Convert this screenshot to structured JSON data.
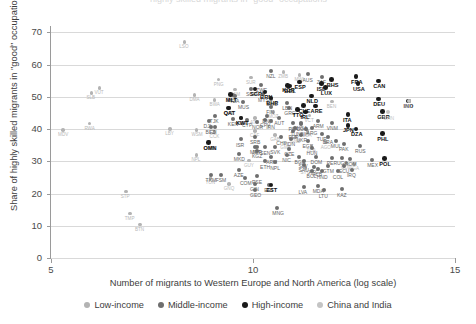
{
  "title_sliver": "highly skilled migrants in \"good\" occupations",
  "axes": {
    "ylabel": "Share of highly skilled migrants in \"good\" occupations (%)",
    "xlabel": "Number of migrants to Western Europe and North America (log scale)",
    "yticks": [
      0,
      10,
      20,
      30,
      40,
      50,
      60,
      70
    ],
    "xticks": [
      5,
      10,
      15
    ],
    "xlim": [
      5,
      15
    ],
    "ylim": [
      0,
      72
    ]
  },
  "legend": {
    "position": "bottom-center",
    "items": [
      {
        "label": "Low-income",
        "color": "#b3b3b3",
        "key": "low"
      },
      {
        "label": "Middle-income",
        "color": "#6e6e6e",
        "key": "mid"
      },
      {
        "label": "High-income",
        "color": "#1a1a1a",
        "key": "high"
      },
      {
        "label": "China and India",
        "color": "#c4c4c4",
        "key": "ci"
      }
    ]
  },
  "chart_data": {
    "type": "scatter",
    "title": "Share of highly skilled migrants in \"good\" occupations",
    "xlabel": "Number of migrants to Western Europe and North America (log scale)",
    "ylabel": "Share of highly skilled migrants in \"good\" occupations (%)",
    "xlim": [
      5,
      15
    ],
    "ylim": [
      0,
      72
    ],
    "grid": "horizontal",
    "series": [
      {
        "name": "Low-income",
        "color": "#b3b3b3",
        "points": [
          {
            "label": "LSO",
            "x": 8.3,
            "y": 67.0
          },
          {
            "label": "MWI",
            "x": 11.15,
            "y": 56.8
          },
          {
            "label": "ZMB",
            "x": 10.75,
            "y": 57.8
          },
          {
            "label": "PNG",
            "x": 9.15,
            "y": 55.4
          },
          {
            "label": "VUT",
            "x": 6.2,
            "y": 52.8
          },
          {
            "label": "SLB",
            "x": 6.0,
            "y": 51.2
          },
          {
            "label": "NAM",
            "x": 9.55,
            "y": 52.3
          },
          {
            "label": "DMA",
            "x": 8.55,
            "y": 50.6
          },
          {
            "label": "BWA",
            "x": 9.05,
            "y": 49.1
          },
          {
            "label": "MOZ",
            "x": 10.5,
            "y": 45.4
          },
          {
            "label": "BEN",
            "x": 11.95,
            "y": 48.6
          },
          {
            "label": "ATG",
            "x": 10.05,
            "y": 43.4
          },
          {
            "label": "VCT",
            "x": 11.4,
            "y": 44.2
          },
          {
            "label": "STP",
            "x": 6.85,
            "y": 20.6
          },
          {
            "label": "TMP",
            "x": 6.95,
            "y": 13.8
          },
          {
            "label": "BTN",
            "x": 7.2,
            "y": 10.4
          },
          {
            "label": "MDV",
            "x": 5.3,
            "y": 39.7
          },
          {
            "label": "WSM",
            "x": 8.6,
            "y": 39.7
          },
          {
            "label": "CCK",
            "x": 9.05,
            "y": 39.1
          },
          {
            "label": "CAF",
            "x": 10.05,
            "y": 39.4
          },
          {
            "label": "GAB",
            "x": 10.55,
            "y": 38.2
          },
          {
            "label": "LCA",
            "x": 11.35,
            "y": 39.5
          },
          {
            "label": "GNB",
            "x": 11.05,
            "y": 37.6
          },
          {
            "label": "AGO",
            "x": 11.8,
            "y": 35.9
          },
          {
            "label": "GMB",
            "x": 10.8,
            "y": 35.8
          },
          {
            "label": "TCA",
            "x": 11.45,
            "y": 34.7
          },
          {
            "label": "GNQ",
            "x": 9.4,
            "y": 22.9
          },
          {
            "label": "TON",
            "x": 8.95,
            "y": 24.9
          },
          {
            "label": "SYC",
            "x": 11.3,
            "y": 28.0
          },
          {
            "label": "COD",
            "x": 12.3,
            "y": 29.6
          },
          {
            "label": "RWA",
            "x": 5.95,
            "y": 41.8
          },
          {
            "label": "LBY",
            "x": 7.95,
            "y": 40.1
          },
          {
            "label": "NPL",
            "x": 8.6,
            "y": 32.0
          },
          {
            "label": "GUY",
            "x": 9.9,
            "y": 30.3
          },
          {
            "label": "UGA",
            "x": 12.5,
            "y": 29.2
          },
          {
            "label": "SUR",
            "x": 9.95,
            "y": 56.0
          }
        ]
      },
      {
        "name": "Middle-income",
        "color": "#6e6e6e",
        "points": [
          {
            "label": "NZL",
            "x": 10.45,
            "y": 58.1
          },
          {
            "label": "AUS",
            "x": 11.35,
            "y": 57.0
          },
          {
            "label": "ZAF",
            "x": 11.7,
            "y": 56.3
          },
          {
            "label": "ZWE",
            "x": 10.2,
            "y": 53.6
          },
          {
            "label": "SGP",
            "x": 9.95,
            "y": 52.4
          },
          {
            "label": "MYS",
            "x": 10.25,
            "y": 50.8
          },
          {
            "label": "TZA",
            "x": 9.55,
            "y": 50.3
          },
          {
            "label": "MUS",
            "x": 9.75,
            "y": 48.5
          },
          {
            "label": "SWE",
            "x": 10.45,
            "y": 49.5
          },
          {
            "label": "LBN",
            "x": 10.85,
            "y": 48.2
          },
          {
            "label": "FIN",
            "x": 10.45,
            "y": 47.0
          },
          {
            "label": "GRC",
            "x": 10.9,
            "y": 46.5
          },
          {
            "label": "QAT",
            "x": 9.4,
            "y": 46.5
          },
          {
            "label": "TJK",
            "x": 9.05,
            "y": 44.2
          },
          {
            "label": "DJI",
            "x": 8.9,
            "y": 42.5
          },
          {
            "label": "KEN",
            "x": 9.5,
            "y": 43.1
          },
          {
            "label": "CPV",
            "x": 10.3,
            "y": 42.8
          },
          {
            "label": "COG",
            "x": 11.2,
            "y": 41.6
          },
          {
            "label": "KWT",
            "x": 9.7,
            "y": 43.6
          },
          {
            "label": "CYP",
            "x": 9.85,
            "y": 42.9
          },
          {
            "label": "DNK",
            "x": 10.35,
            "y": 44.2
          },
          {
            "label": "AUT",
            "x": 10.65,
            "y": 43.4
          },
          {
            "label": "NOR",
            "x": 10.1,
            "y": 42.3
          },
          {
            "label": "IRN",
            "x": 10.45,
            "y": 42.4
          },
          {
            "label": "PSA",
            "x": 11.0,
            "y": 41.8
          },
          {
            "label": "TUN",
            "x": 11.05,
            "y": 40.2
          },
          {
            "label": "ARG",
            "x": 11.45,
            "y": 40.3
          },
          {
            "label": "PER",
            "x": 11.0,
            "y": 39.3
          },
          {
            "label": "UKR",
            "x": 11.2,
            "y": 38.3
          },
          {
            "label": "TUR",
            "x": 11.7,
            "y": 38.4
          },
          {
            "label": "BRA",
            "x": 11.85,
            "y": 37.5
          },
          {
            "label": "SRB",
            "x": 10.05,
            "y": 37.7
          },
          {
            "label": "ISR",
            "x": 9.7,
            "y": 36.8
          },
          {
            "label": "CHL",
            "x": 10.7,
            "y": 37.4
          },
          {
            "label": "IDN",
            "x": 10.95,
            "y": 36.9
          },
          {
            "label": "EGY",
            "x": 11.35,
            "y": 36.3
          },
          {
            "label": "MUI",
            "x": 12.05,
            "y": 36.3
          },
          {
            "label": "OMN",
            "x": 8.9,
            "y": 35.9
          },
          {
            "label": "MRT",
            "x": 10.05,
            "y": 34.6
          },
          {
            "label": "KGZ",
            "x": 10.1,
            "y": 33.2
          },
          {
            "label": "JOR",
            "x": 10.1,
            "y": 34.5
          },
          {
            "label": "SEN",
            "x": 10.3,
            "y": 34.3
          },
          {
            "label": "SVK",
            "x": 10.55,
            "y": 34.4
          },
          {
            "label": "CZE",
            "x": 10.9,
            "y": 33.8
          },
          {
            "label": "HUN",
            "x": 11.45,
            "y": 34.1
          },
          {
            "label": "NGA",
            "x": 11.2,
            "y": 42.0
          },
          {
            "label": "PAK",
            "x": 12.25,
            "y": 35.3
          },
          {
            "label": "RUS",
            "x": 12.65,
            "y": 34.7
          },
          {
            "label": "NIC",
            "x": 10.85,
            "y": 32.1
          },
          {
            "label": "ARM",
            "x": 10.45,
            "y": 31.5
          },
          {
            "label": "BGR",
            "x": 11.15,
            "y": 31.3
          },
          {
            "label": "DOM",
            "x": 11.55,
            "y": 31.3
          },
          {
            "label": "PER2",
            "x": 11.95,
            "y": 31.0
          },
          {
            "label": "UGA2",
            "x": 12.2,
            "y": 31.0
          },
          {
            "label": "ROM",
            "x": 12.4,
            "y": 30.8
          },
          {
            "label": "MEX",
            "x": 12.95,
            "y": 30.5
          },
          {
            "label": "SLV",
            "x": 11.25,
            "y": 30.1
          },
          {
            "label": "ETH",
            "x": 10.3,
            "y": 30.0
          },
          {
            "label": "NPL2",
            "x": 10.55,
            "y": 29.7
          },
          {
            "label": "SAU",
            "x": 11.25,
            "y": 28.9
          },
          {
            "label": "AFG",
            "x": 11.5,
            "y": 28.3
          },
          {
            "label": "GTM",
            "x": 11.85,
            "y": 28.6
          },
          {
            "label": "ECU",
            "x": 12.25,
            "y": 28.5
          },
          {
            "label": "ALB",
            "x": 11.6,
            "y": 27.6
          },
          {
            "label": "MKD",
            "x": 9.65,
            "y": 32.3
          },
          {
            "label": "AZE",
            "x": 9.65,
            "y": 27.3
          },
          {
            "label": "TKM",
            "x": 8.95,
            "y": 25.9
          },
          {
            "label": "FSM",
            "x": 9.2,
            "y": 25.7
          },
          {
            "label": "COM",
            "x": 9.8,
            "y": 24.8
          },
          {
            "label": "PSE",
            "x": 10.1,
            "y": 25.3
          },
          {
            "label": "GIN",
            "x": 10.05,
            "y": 23.0
          },
          {
            "label": "MNG",
            "x": 10.6,
            "y": 15.6
          },
          {
            "label": "HND",
            "x": 11.7,
            "y": 26.9
          },
          {
            "label": "BOL",
            "x": 11.45,
            "y": 27.0
          },
          {
            "label": "COL",
            "x": 12.1,
            "y": 26.9
          },
          {
            "label": "IRQ",
            "x": 12.45,
            "y": 27.3
          },
          {
            "label": "EST",
            "x": 10.4,
            "y": 22.6
          },
          {
            "label": "GEO",
            "x": 10.05,
            "y": 21.2
          },
          {
            "label": "LVA",
            "x": 11.25,
            "y": 22.1
          },
          {
            "label": "MDA",
            "x": 11.6,
            "y": 22.5
          },
          {
            "label": "LTU",
            "x": 11.75,
            "y": 21.0
          },
          {
            "label": "KAZ",
            "x": 12.2,
            "y": 21.3
          },
          {
            "label": "VNM",
            "x": 11.95,
            "y": 41.9
          },
          {
            "label": "ARM2",
            "x": 11.6,
            "y": 42.5
          },
          {
            "label": "BIH",
            "x": 11.3,
            "y": 40.1
          },
          {
            "label": "FJI",
            "x": 9.05,
            "y": 40.6
          },
          {
            "label": "BLZ",
            "x": 8.95,
            "y": 40.8
          },
          {
            "label": "MLT",
            "x": 9.5,
            "y": 50.6
          }
        ]
      },
      {
        "name": "High-income",
        "color": "#1a1a1a",
        "points": [
          {
            "label": "BHS",
            "x": 11.95,
            "y": 55.4
          },
          {
            "label": "ISL",
            "x": 11.7,
            "y": 54.1
          },
          {
            "label": "LUX",
            "x": 11.8,
            "y": 52.9
          },
          {
            "label": "BRN",
            "x": 10.3,
            "y": 51.5
          },
          {
            "label": "BHR",
            "x": 10.45,
            "y": 49.6
          },
          {
            "label": "ARE",
            "x": 11.55,
            "y": 47.2
          },
          {
            "label": "FRA",
            "x": 12.55,
            "y": 56.3
          },
          {
            "label": "CAN",
            "x": 13.1,
            "y": 54.9
          },
          {
            "label": "USA",
            "x": 12.6,
            "y": 54.2
          },
          {
            "label": "ESP",
            "x": 11.15,
            "y": 54.6
          },
          {
            "label": "BEL",
            "x": 10.9,
            "y": 53.4
          },
          {
            "label": "KOR",
            "x": 10.85,
            "y": 53.6
          },
          {
            "label": "NLD",
            "x": 11.45,
            "y": 50.3
          },
          {
            "label": "DEU",
            "x": 13.1,
            "y": 49.4
          },
          {
            "label": "IND",
            "x": 13.85,
            "y": 48.7
          },
          {
            "label": "GBR",
            "x": 13.2,
            "y": 45.5
          },
          {
            "label": "IRL",
            "x": 11.3,
            "y": 45.3
          },
          {
            "label": "ITA",
            "x": 12.35,
            "y": 44.5
          },
          {
            "label": "JPN",
            "x": 12.35,
            "y": 41.2
          },
          {
            "label": "TTO",
            "x": 11.1,
            "y": 46.0
          },
          {
            "label": "CHE",
            "x": 11.25,
            "y": 47.3
          },
          {
            "label": "DZA",
            "x": 12.55,
            "y": 40.0
          },
          {
            "label": "PHL",
            "x": 13.2,
            "y": 38.6
          },
          {
            "label": "POL",
            "x": 13.25,
            "y": 30.8
          },
          {
            "label": "MLT",
            "x": 9.45,
            "y": 50.7
          },
          {
            "label": "SGP2",
            "x": 10.05,
            "y": 52.4
          },
          {
            "label": "QAT",
            "x": 9.4,
            "y": 46.6
          },
          {
            "label": "OMN2",
            "x": 8.9,
            "y": 35.9
          },
          {
            "label": "KWT2",
            "x": 9.7,
            "y": 43.5
          },
          {
            "label": "EST2",
            "x": 10.45,
            "y": 22.6
          }
        ]
      },
      {
        "name": "China and India",
        "color": "#c4c4c4",
        "points": [
          {
            "label": "IND",
            "x": 13.85,
            "y": 48.7
          },
          {
            "label": "CHN",
            "x": 13.35,
            "y": 45.2
          }
        ]
      }
    ]
  }
}
